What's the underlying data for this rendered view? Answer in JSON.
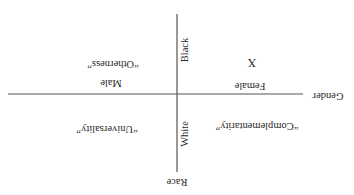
{
  "diagram": {
    "orientation": "rotated-180",
    "colors": {
      "background": "#ffffff",
      "axis": "#555555",
      "text": "#2a2a2a"
    },
    "axes": {
      "horizontal": {
        "title": "Gender",
        "negative_end_label": "Male",
        "positive_end_label": "Female"
      },
      "vertical": {
        "title": "Race",
        "top_label": "Black",
        "bottom_label": "White"
      }
    },
    "quadrants": {
      "top_left": "“Otherness”",
      "top_right": "X",
      "bottom_left": "“Universality”",
      "bottom_right": "“Complementarity”"
    }
  }
}
